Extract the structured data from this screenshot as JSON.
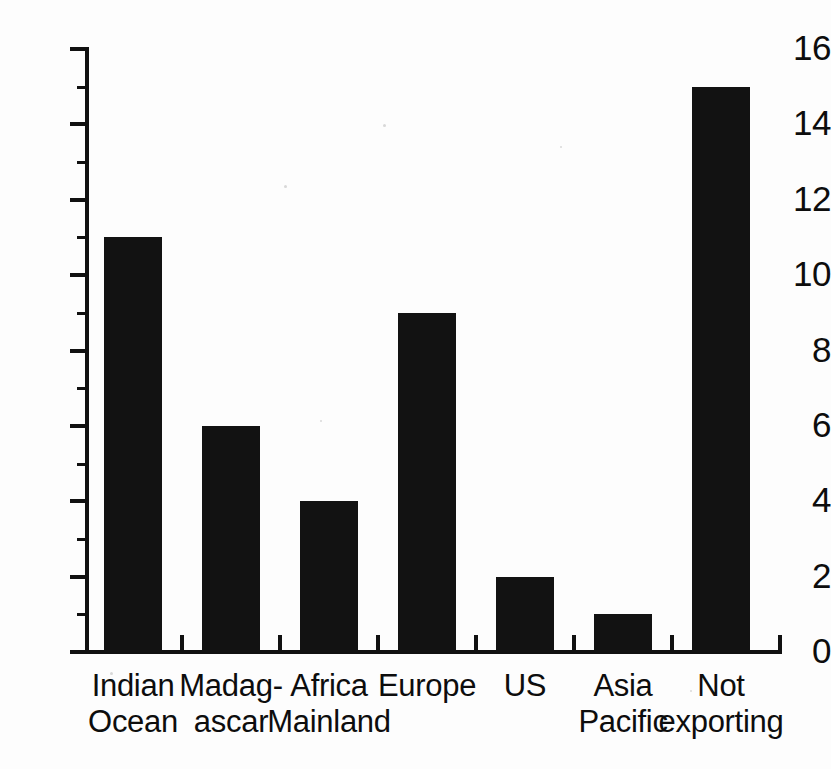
{
  "chart_data": {
    "type": "bar",
    "title": "",
    "subtitle": "",
    "xlabel": "",
    "ylabel": "",
    "categories": [
      "Indian\nOcean",
      "Madag-\nascar",
      "Africa\nMainland",
      "Europe",
      "US",
      "Asia\nPacific",
      "Not\nexporting"
    ],
    "category_lines": [
      [
        "Indian",
        "Ocean"
      ],
      [
        "Madag-",
        "ascar"
      ],
      [
        "Africa",
        "Mainland"
      ],
      [
        "Europe",
        ""
      ],
      [
        "US",
        ""
      ],
      [
        "Asia",
        "Pacific"
      ],
      [
        "Not",
        "exporting"
      ]
    ],
    "values": [
      11,
      6,
      4,
      9,
      2,
      1,
      15
    ],
    "ylim": [
      0,
      16
    ],
    "ytick_major": [
      0,
      2,
      4,
      6,
      8,
      10,
      12,
      14,
      16
    ],
    "ytick_minor": [
      1,
      3,
      5,
      7,
      9,
      11,
      13,
      15
    ],
    "ytick_labels": [
      "0",
      "2",
      "4",
      "6",
      "8",
      "10",
      "12",
      "14",
      "16"
    ],
    "grid": false,
    "legend": null,
    "bar_color": "#121212",
    "axis_color": "#111111",
    "background_color": "#ffffff"
  },
  "axis": {
    "y_labels": [
      "16",
      "14",
      "12",
      "10",
      "8",
      "6",
      "4",
      "2",
      "0"
    ]
  }
}
